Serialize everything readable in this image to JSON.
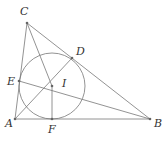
{
  "diagram": {
    "points": {
      "A": {
        "label": "A",
        "x": 15,
        "y": 119,
        "lx": 5,
        "ly": 127
      },
      "B": {
        "label": "B",
        "x": 150,
        "y": 119,
        "lx": 154,
        "ly": 127
      },
      "C": {
        "label": "C",
        "x": 27,
        "y": 23,
        "lx": 20,
        "ly": 15
      },
      "D": {
        "label": "D",
        "x": 72,
        "y": 58,
        "lx": 76,
        "ly": 55
      },
      "E": {
        "label": "E",
        "x": 19,
        "y": 81,
        "lx": 7,
        "ly": 85
      },
      "F": {
        "label": "F",
        "x": 52,
        "y": 119,
        "lx": 48,
        "ly": 133
      },
      "I": {
        "label": "I",
        "x": 52,
        "y": 86,
        "lx": 62,
        "ly": 87
      }
    },
    "incircle": {
      "cx": 52,
      "cy": 86,
      "r": 33
    },
    "segments": [
      [
        "A",
        "B"
      ],
      [
        "B",
        "C"
      ],
      [
        "C",
        "A"
      ],
      [
        "C",
        "I"
      ],
      [
        "A",
        "D"
      ],
      [
        "E",
        "B"
      ],
      [
        "I",
        "F"
      ]
    ]
  }
}
